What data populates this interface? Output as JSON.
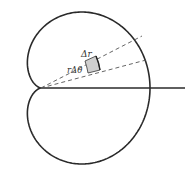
{
  "figure": {
    "type": "polar-area-element",
    "curve": "cardioid",
    "labels": {
      "delta_r": "Δr",
      "r_delta_theta": "rΔθ"
    },
    "colors": {
      "curve": "#2a2a2a",
      "axis": "#2a2a2a",
      "dashed": "#555555",
      "shaded": "#cfcfcf"
    }
  }
}
